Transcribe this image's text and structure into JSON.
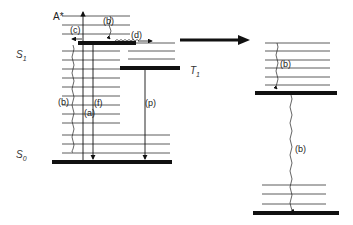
{
  "diagram": {
    "type": "jablonski-energy-diagram",
    "states": {
      "excited": "A*",
      "s1": {
        "main": "S",
        "sub": "1"
      },
      "s0": {
        "main": "S",
        "sub": "0"
      },
      "t1": {
        "main": "T",
        "sub": "1"
      }
    },
    "process_labels": {
      "b_top": "(b)",
      "c": "(c)",
      "d": "(d)",
      "b_left": "(b)",
      "a": "(a)",
      "f": "(f)",
      "p": "(p)",
      "b_right_upper": "(b)",
      "b_right_lower": "(b)"
    },
    "colors": {
      "line": "#111111",
      "background": "#ffffff"
    }
  }
}
